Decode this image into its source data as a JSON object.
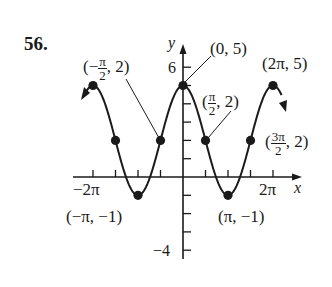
{
  "problem_number": "56.",
  "chart_data": {
    "type": "line",
    "title": "",
    "function": "y = 2 + 3cos(x)",
    "xlabel": "x",
    "ylabel": "y",
    "xlim": [
      -6.9,
      7.1
    ],
    "ylim": [
      -4.5,
      6.5
    ],
    "grid": false,
    "x_tick_labels": [
      "-2π",
      "2π"
    ],
    "y_tick_labels": [
      "6",
      "-4"
    ],
    "x_tick_spacing": "π/2",
    "y_tick_spacing": 1,
    "points": [
      {
        "x": "-2π",
        "xv": -6.2832,
        "y": 5,
        "label": ""
      },
      {
        "x": "-3π/2",
        "xv": -4.7124,
        "y": 2,
        "label": ""
      },
      {
        "x": "-π",
        "xv": -3.1416,
        "y": -1,
        "label": "(−π, −1)"
      },
      {
        "x": "-π/2",
        "xv": -1.5708,
        "y": 2,
        "label": "(−π/2, 2)"
      },
      {
        "x": "0",
        "xv": 0,
        "y": 5,
        "label": "(0, 5)"
      },
      {
        "x": "π/2",
        "xv": 1.5708,
        "y": 2,
        "label": "(π/2, 2)"
      },
      {
        "x": "π",
        "xv": 3.1416,
        "y": -1,
        "label": "(π, −1)"
      },
      {
        "x": "3π/2",
        "xv": 4.7124,
        "y": 2,
        "label": "(3π/2, 2)"
      },
      {
        "x": "2π",
        "xv": 6.2832,
        "y": 5,
        "label": "(2π, 5)"
      }
    ],
    "annotations": [
      "(−π/2, 2)",
      "(0, 5)",
      "(π/2, 2)",
      "(2π, 5)",
      "(3π/2, 2)",
      "(−π, −1)",
      "(π, −1)"
    ],
    "legend": "none"
  },
  "labels": {
    "y_axis": "y",
    "x_axis": "x",
    "y_tick_top": "6",
    "y_tick_bottom": "−4",
    "x_tick_left": "−2π",
    "x_tick_right": "2π",
    "neg_pi_half_open": "(−",
    "pi": "π",
    "two": "2",
    "pt_neg_pi_half_close": ", 2)",
    "pt_zero_five": "(0, 5)",
    "pi_half_open": "(",
    "pt_pi_half_close": ", 2)",
    "pt_two_pi_five": "(2π, 5)",
    "three_pi": "3π",
    "pt_three_pi_half_close": ", 2)",
    "pt_neg_pi_neg_one": "(−π, −1)",
    "pt_pi_neg_one": "(π, −1)"
  },
  "colors": {
    "ink": "#1a1a1a",
    "background": "#ffffff"
  }
}
